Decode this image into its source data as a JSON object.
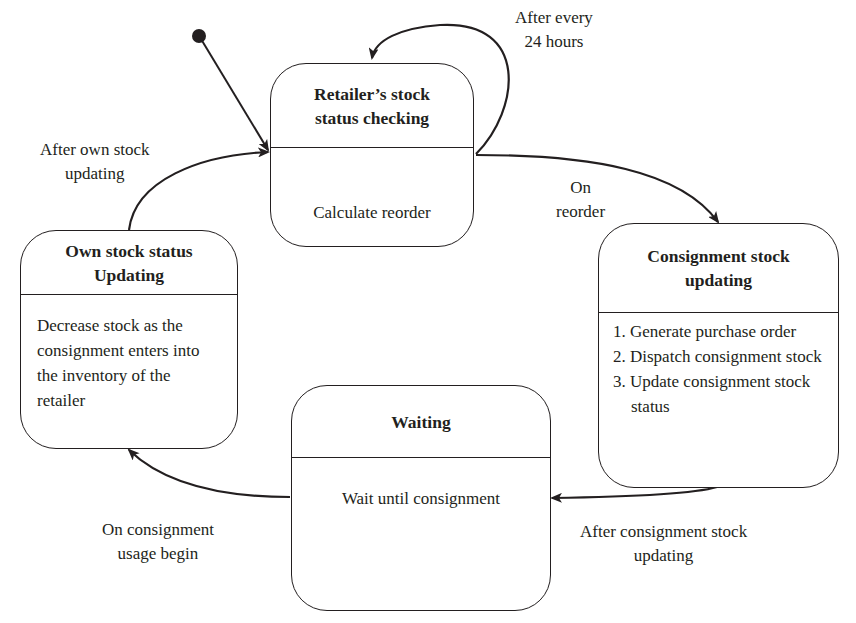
{
  "diagram": {
    "type": "state-machine",
    "initial_state": "retailer_check",
    "states": {
      "retailer_check": {
        "title": "Retailer’s stock status checking",
        "activity": "Calculate reorder"
      },
      "consignment_update": {
        "title": "Consignment stock updating",
        "activities": [
          "1. Generate purchase order",
          "2. Dispatch consignment stock",
          "3. Update consignment stock status"
        ]
      },
      "waiting": {
        "title": "Waiting",
        "activity": "Wait until consignment"
      },
      "own_update": {
        "title": "Own stock status Updating",
        "activity": "Decrease stock as the consignment enters into the inventory of the  retailer"
      }
    },
    "transitions": {
      "self_loop": {
        "from": "retailer_check",
        "to": "retailer_check",
        "label_line1": "After every",
        "label_line2": "24 hours"
      },
      "reorder": {
        "from": "retailer_check",
        "to": "consignment_update",
        "label_line1": "On",
        "label_line2": "reorder"
      },
      "after_consignment": {
        "from": "consignment_update",
        "to": "waiting",
        "label_line1": "After consignment stock",
        "label_line2": "updating"
      },
      "usage_begin": {
        "from": "waiting",
        "to": "own_update",
        "label_line1": "On consignment",
        "label_line2": "usage begin"
      },
      "after_own": {
        "from": "own_update",
        "to": "retailer_check",
        "label_line1": "After own stock",
        "label_line2": "updating"
      }
    },
    "colors": {
      "stroke": "#231f20",
      "background": "#ffffff"
    }
  }
}
